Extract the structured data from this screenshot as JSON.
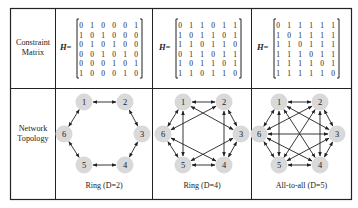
{
  "table": {
    "row_labels": [
      {
        "line1": "Constraint",
        "line2": "Matrix"
      },
      {
        "line1": "Network",
        "line2": "Topology"
      }
    ],
    "matrix_symbol": "H",
    "equals": "=",
    "columns": [
      {
        "caption": "Ring (D=2)",
        "matrix": [
          [
            0,
            1,
            0,
            0,
            0,
            1
          ],
          [
            1,
            0,
            1,
            0,
            0,
            0
          ],
          [
            0,
            1,
            0,
            1,
            0,
            0
          ],
          [
            0,
            0,
            1,
            0,
            1,
            0
          ],
          [
            0,
            0,
            0,
            1,
            0,
            1
          ],
          [
            1,
            0,
            0,
            0,
            1,
            0
          ]
        ],
        "edges": [
          [
            1,
            2
          ],
          [
            2,
            3
          ],
          [
            3,
            4
          ],
          [
            4,
            5
          ],
          [
            5,
            6
          ],
          [
            6,
            1
          ]
        ]
      },
      {
        "caption": "Ring (D=4)",
        "matrix": [
          [
            0,
            1,
            1,
            0,
            1,
            1
          ],
          [
            1,
            0,
            1,
            1,
            0,
            1
          ],
          [
            1,
            1,
            0,
            1,
            1,
            0
          ],
          [
            0,
            1,
            1,
            0,
            1,
            1
          ],
          [
            1,
            0,
            1,
            1,
            0,
            1
          ],
          [
            1,
            1,
            0,
            1,
            1,
            0
          ]
        ],
        "edges": [
          [
            1,
            2
          ],
          [
            2,
            3
          ],
          [
            3,
            4
          ],
          [
            4,
            5
          ],
          [
            5,
            6
          ],
          [
            6,
            1
          ],
          [
            1,
            3
          ],
          [
            1,
            5
          ],
          [
            2,
            4
          ],
          [
            2,
            6
          ],
          [
            3,
            5
          ],
          [
            4,
            6
          ]
        ]
      },
      {
        "caption": "All-to-all (D=5)",
        "matrix": [
          [
            0,
            1,
            1,
            1,
            1,
            1
          ],
          [
            1,
            0,
            1,
            1,
            1,
            1
          ],
          [
            1,
            1,
            0,
            1,
            1,
            1
          ],
          [
            1,
            1,
            1,
            0,
            1,
            1
          ],
          [
            1,
            1,
            1,
            1,
            0,
            1
          ],
          [
            1,
            1,
            1,
            1,
            1,
            0
          ]
        ],
        "edges": [
          [
            1,
            2
          ],
          [
            2,
            3
          ],
          [
            3,
            4
          ],
          [
            4,
            5
          ],
          [
            5,
            6
          ],
          [
            6,
            1
          ],
          [
            1,
            3
          ],
          [
            1,
            5
          ],
          [
            2,
            4
          ],
          [
            2,
            6
          ],
          [
            3,
            5
          ],
          [
            4,
            6
          ],
          [
            1,
            4
          ],
          [
            2,
            5
          ],
          [
            3,
            6
          ]
        ]
      }
    ],
    "node_labels": [
      "1",
      "2",
      "3",
      "4",
      "5",
      "6"
    ]
  },
  "colors": {
    "border": "#222222",
    "node_fill": "#d9d9d9",
    "text": "#222222",
    "arrow": "#222222"
  }
}
